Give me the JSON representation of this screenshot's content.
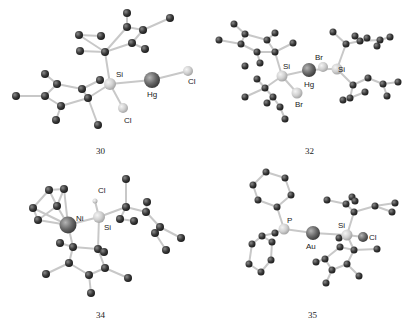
{
  "figure": {
    "panels": [
      {
        "id": "30",
        "caption": "30",
        "atom_labels": {
          "si": "Si",
          "hg": "Hg",
          "cl1": "Cl",
          "cl2": "Cl"
        }
      },
      {
        "id": "32",
        "caption": "32",
        "atom_labels": {
          "si1": "Si",
          "si2": "Si",
          "hg": "Hg",
          "br1": "Br",
          "br2": "Br"
        }
      },
      {
        "id": "34",
        "caption": "34",
        "atom_labels": {
          "ni": "Ni",
          "si": "Si",
          "cl": "Cl"
        }
      },
      {
        "id": "35",
        "caption": "35",
        "atom_labels": {
          "p": "P",
          "au": "Au",
          "si": "Si",
          "cl": "Cl"
        }
      }
    ],
    "colors": {
      "carbon": "#3a3a3a",
      "bond": "#c8c8c8",
      "heavy_metal": "#6a6a6a",
      "light_heteroatom": "#d8d8d8"
    }
  }
}
